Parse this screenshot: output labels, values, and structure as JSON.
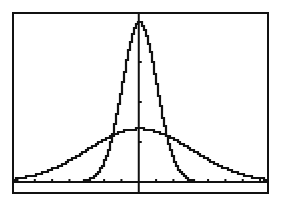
{
  "chart_data": {
    "type": "line",
    "title": "",
    "xlabel": "",
    "ylabel": "",
    "xlim": [
      -7.2,
      7.4
    ],
    "ylim": [
      -0.025,
      0.42
    ],
    "xscl": 1,
    "yscl": 0.1,
    "grid": false,
    "legend": null,
    "series": [
      {
        "name": "normal pdf, mean 0, sd 1",
        "mean": 0,
        "sd": 1,
        "x": [
          -3,
          -2.5,
          -2,
          -1.5,
          -1,
          -0.5,
          0,
          0.5,
          1,
          1.5,
          2,
          2.5,
          3
        ],
        "values": [
          0.004,
          0.018,
          0.054,
          0.13,
          0.242,
          0.352,
          0.399,
          0.352,
          0.242,
          0.13,
          0.054,
          0.018,
          0.004
        ]
      },
      {
        "name": "normal pdf, mean 0, sd 3",
        "mean": 0,
        "sd": 3,
        "x": [
          -7,
          -6,
          -5,
          -4,
          -3,
          -2,
          -1,
          0,
          1,
          2,
          3,
          4,
          5,
          6,
          7
        ],
        "values": [
          0.009,
          0.018,
          0.033,
          0.055,
          0.081,
          0.106,
          0.126,
          0.133,
          0.126,
          0.106,
          0.081,
          0.055,
          0.033,
          0.018,
          0.009
        ]
      }
    ]
  },
  "colors": {
    "ink": "#111111",
    "background": "#ffffff"
  }
}
